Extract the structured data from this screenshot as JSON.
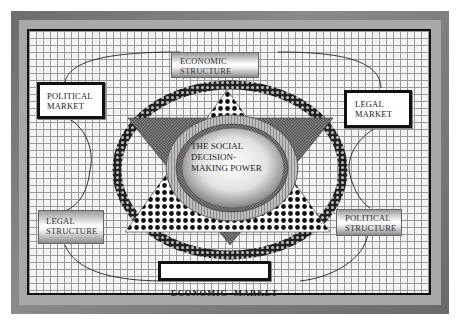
{
  "diagram": {
    "center": {
      "label_lines": [
        "THE SOCIAL",
        "DECISION-",
        "MAKING POWER"
      ]
    },
    "nodes": [
      {
        "id": "economic-structure",
        "label_lines": [
          "ECONOMIC",
          "STRUCTURE"
        ],
        "style": "gradient",
        "position": "top"
      },
      {
        "id": "political-market",
        "label_lines": [
          "POLITICAL",
          "MARKET"
        ],
        "style": "white-bordered",
        "position": "upper-left"
      },
      {
        "id": "legal-market",
        "label_lines": [
          "LEGAL",
          "MARKET"
        ],
        "style": "white-bordered",
        "position": "upper-right"
      },
      {
        "id": "legal-structure",
        "label_lines": [
          "LEGAL",
          "STRUCTURE"
        ],
        "style": "gradient",
        "position": "lower-left"
      },
      {
        "id": "political-structure",
        "label_lines": [
          "POLITICAL",
          "STRUCTURE"
        ],
        "style": "gradient",
        "position": "lower-right"
      },
      {
        "id": "economic-market",
        "label_lines": [
          "ECONOMIC  MARKET"
        ],
        "style": "white-bordered-bold",
        "position": "bottom"
      }
    ],
    "connections": [
      [
        "political-market",
        "economic-structure"
      ],
      [
        "economic-structure",
        "legal-market"
      ],
      [
        "political-market",
        "legal-structure"
      ],
      [
        "legal-market",
        "political-structure"
      ],
      [
        "legal-structure",
        "economic-market"
      ],
      [
        "political-structure",
        "economic-market"
      ]
    ],
    "shapes": {
      "outer_ring": "dotted dark elliptical ring",
      "star": "hexagram of two triangles (up: black-dot pattern, down: gray crosshatch)",
      "inner_ring": "gray hatched ring around gradient ellipse"
    },
    "colors": {
      "frame_dark": "#6d6d6d",
      "frame_light": "#a9a9a9",
      "grid_line": "#9a9a9a",
      "border": "#111111"
    }
  }
}
